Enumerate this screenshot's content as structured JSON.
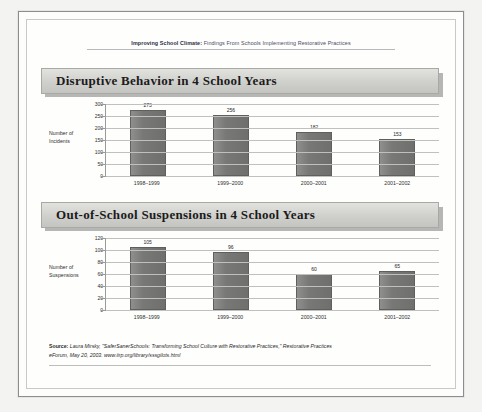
{
  "document": {
    "running_head_bold": "Improving School Climate:",
    "running_head_rest": " Findings From Schools Implementing Restorative Practices"
  },
  "charts": [
    {
      "title": "Disruptive Behavior in 4 School Years",
      "axis_title_line1": "Number of",
      "axis_title_line2": "Incidents"
    },
    {
      "title": "Out-of-School Suspensions in 4 School Years",
      "axis_title_line1": "Number of",
      "axis_title_line2": "Suspensions"
    }
  ],
  "source": {
    "label": "Source:",
    "line1": " Laura Mirsky, \"SaferSanerSchools: Transforming School Culture with Restorative Practices,\" Restorative Practices",
    "line2": "eForum, May 20, 2003. www.iirp.org/library/sssgilots.html"
  },
  "chart_data": [
    {
      "type": "bar",
      "title": "Disruptive Behavior in 4 School Years",
      "xlabel": "",
      "ylabel": "Number of Incidents",
      "categories": [
        "1998–1999",
        "1999–2000",
        "2000–2001",
        "2001–2002"
      ],
      "values": [
        273,
        256,
        182,
        153
      ],
      "value_labels": [
        "273",
        "256",
        "182",
        "153"
      ],
      "yticks": [
        0,
        50,
        100,
        150,
        200,
        250,
        300
      ],
      "ytick_labels": [
        "0",
        "50",
        "100",
        "150",
        "200",
        "250",
        "300"
      ],
      "ylim": [
        0,
        300
      ],
      "grid": true,
      "legend": false,
      "bar_color": "#787876"
    },
    {
      "type": "bar",
      "title": "Out-of-School Suspensions in 4 School Years",
      "xlabel": "",
      "ylabel": "Number of Suspensions",
      "categories": [
        "1998–1999",
        "1999–2000",
        "2000–2001",
        "2001–2002"
      ],
      "values": [
        105,
        96,
        60,
        65
      ],
      "value_labels": [
        "105",
        "96",
        "60",
        "65"
      ],
      "yticks": [
        0,
        20,
        40,
        60,
        80,
        100,
        120
      ],
      "ytick_labels": [
        "0",
        "20",
        "40",
        "60",
        "80",
        "100",
        "120"
      ],
      "ylim": [
        0,
        120
      ],
      "grid": true,
      "legend": false,
      "bar_color": "#787876"
    }
  ]
}
